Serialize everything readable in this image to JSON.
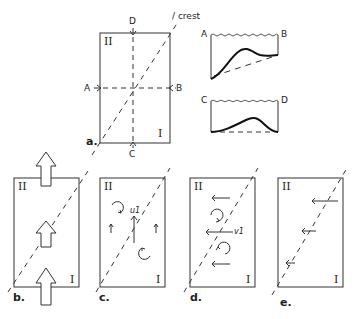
{
  "labels": {
    "crest": "/ crest",
    "points": {
      "A": "A",
      "B": "B",
      "C": "C",
      "D": "D"
    },
    "regions": {
      "one": "I",
      "two": "II"
    },
    "panels": {
      "a": "a.",
      "b": "b.",
      "c": "c.",
      "d": "d.",
      "e": "e."
    },
    "symbols": {
      "u1": "u1",
      "v1": "v1"
    }
  },
  "profiles": {
    "AB": {
      "left": "A",
      "right": "B"
    },
    "CD": {
      "left": "C",
      "right": "D"
    }
  },
  "colors": {
    "line": "#333333",
    "profile": "#111111",
    "dash": "#555555"
  }
}
